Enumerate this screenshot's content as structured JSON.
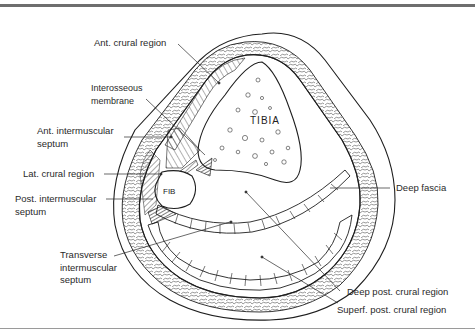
{
  "figure": {
    "bone_labels": {
      "tibia": "TIBIA",
      "fibula": "FIB"
    },
    "labels": [
      {
        "id": "ant-crural-region",
        "text": "Ant. crural region"
      },
      {
        "id": "interosseous-membrane",
        "text": "Interosseous\nmembrane"
      },
      {
        "id": "ant-intermuscular-septum",
        "text": "Ant. intermuscular\nseptum"
      },
      {
        "id": "lat-crural-region",
        "text": "Lat. crural region"
      },
      {
        "id": "post-intermuscular-septum",
        "text": "Post. intermuscular\nseptum"
      },
      {
        "id": "transverse-intermuscular-septum",
        "text": "Transverse\nintermuscular\nseptum"
      },
      {
        "id": "deep-fascia",
        "text": "Deep fascia"
      },
      {
        "id": "deep-post-crural-region",
        "text": "Deep post. crural region"
      },
      {
        "id": "superf-post-crural-region",
        "text": "Superf. post. crural region"
      }
    ],
    "colors": {
      "line": "#1e1e1e",
      "frame": "#6e6e6e",
      "background": "#ffffff"
    }
  }
}
